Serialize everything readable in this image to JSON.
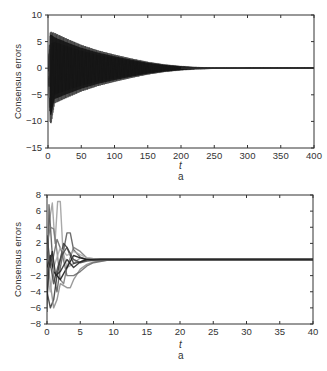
{
  "chart_data": [
    {
      "type": "line",
      "title": "",
      "xlabel": "t",
      "ylabel": "Consensus errors",
      "sublabel": "a",
      "xlim": [
        0,
        400
      ],
      "ylim": [
        -15,
        10
      ],
      "xticks": [
        0,
        50,
        100,
        150,
        200,
        250,
        300,
        350,
        400
      ],
      "yticks": [
        10,
        5,
        0,
        -5,
        -10,
        -15
      ],
      "grid": false,
      "legend": null,
      "description": "Many oscillating error trajectories forming a decaying envelope; converge to 0 around t≈250",
      "envelope": {
        "t": [
          0,
          3,
          5,
          10,
          25,
          50,
          75,
          100,
          125,
          150,
          175,
          200,
          225,
          250,
          300,
          400
        ],
        "upper": [
          0,
          9,
          9,
          8.3,
          7.2,
          5.5,
          4.2,
          3.2,
          2.3,
          1.5,
          0.9,
          0.5,
          0.2,
          0.05,
          0,
          0
        ],
        "lower": [
          0,
          -12.5,
          -12.5,
          -8.3,
          -7.2,
          -5.5,
          -4.2,
          -3.2,
          -2.3,
          -1.5,
          -0.9,
          -0.5,
          -0.2,
          -0.05,
          0,
          0
        ]
      },
      "oscillation_period": 5.5
    },
    {
      "type": "line",
      "title": "",
      "xlabel": "t",
      "ylabel": "Consensus errors",
      "sublabel": "a",
      "xlim": [
        0,
        40
      ],
      "ylim": [
        -8,
        8
      ],
      "xticks": [
        0,
        5,
        10,
        15,
        20,
        25,
        30,
        35,
        40
      ],
      "yticks": [
        8,
        6,
        4,
        2,
        0,
        -2,
        -4,
        -6,
        -8
      ],
      "grid": false,
      "legend": null,
      "description": "Multiple grey/black trajectories with transient spikes converging to 0 by t≈10",
      "series": [
        {
          "name": "s1",
          "color": "#9a9a9a",
          "t": [
            0,
            0.4,
            0.8,
            1.2,
            1.6,
            2.0,
            2.4,
            3,
            4,
            5,
            6,
            8,
            10,
            40
          ],
          "values": [
            0,
            5,
            7,
            2,
            7.2,
            7.2,
            1,
            -1,
            -0.5,
            0.2,
            0,
            0,
            0,
            0
          ]
        },
        {
          "name": "s2",
          "color": "#555555",
          "t": [
            0,
            0.3,
            0.6,
            1,
            1.5,
            2,
            3,
            3.5,
            4,
            5,
            6,
            8,
            10,
            40
          ],
          "values": [
            -6.5,
            6.8,
            3,
            -2,
            -4,
            -1,
            3.3,
            3.3,
            1.2,
            0.3,
            0,
            0,
            0,
            0
          ]
        },
        {
          "name": "s3",
          "color": "#777777",
          "t": [
            0,
            0.5,
            1,
            1.5,
            2,
            2.5,
            3,
            4,
            5,
            6,
            8,
            10,
            40
          ],
          "values": [
            2,
            4,
            3.8,
            1,
            -2.5,
            -3,
            -1,
            1.5,
            1,
            0.2,
            0,
            0,
            0
          ]
        },
        {
          "name": "s4",
          "color": "#333333",
          "t": [
            0,
            0.5,
            1,
            1.5,
            2,
            2.5,
            3,
            4,
            5,
            6,
            8,
            10,
            40
          ],
          "values": [
            -4,
            -6,
            -5,
            -2,
            0,
            2,
            1.5,
            -0.5,
            -0.3,
            0,
            0,
            0,
            0
          ]
        },
        {
          "name": "s5",
          "color": "#888888",
          "t": [
            0,
            0.5,
            1,
            1.5,
            2,
            3,
            3.5,
            4,
            5,
            6,
            7,
            9,
            12,
            40
          ],
          "values": [
            0.5,
            -3,
            -6,
            -5,
            -3,
            -3.5,
            -3.5,
            -2.5,
            -1.2,
            -0.6,
            -0.3,
            -0.1,
            0,
            0
          ]
        },
        {
          "name": "s6",
          "color": "#111111",
          "t": [
            0,
            0.5,
            1,
            1.5,
            2,
            3,
            4,
            5,
            6,
            8,
            10,
            40
          ],
          "values": [
            -1,
            0.5,
            -1.5,
            -2,
            -2.5,
            -1,
            0.5,
            0.2,
            0,
            0,
            0,
            0
          ]
        },
        {
          "name": "s7",
          "color": "#666666",
          "t": [
            0,
            0.5,
            1,
            1.5,
            2.2,
            3,
            4,
            5,
            6,
            7,
            9,
            12,
            40
          ],
          "values": [
            1,
            -1,
            0.5,
            2.5,
            1,
            -2,
            -2,
            -1.5,
            -0.8,
            -0.4,
            -0.1,
            0,
            0
          ]
        },
        {
          "name": "s8",
          "color": "#aaaaaa",
          "t": [
            0,
            0.5,
            1,
            2,
            3,
            4,
            5,
            6,
            8,
            10,
            40
          ],
          "values": [
            -2,
            -4,
            -1,
            1.5,
            0.5,
            1,
            0.6,
            0.2,
            0,
            0,
            0
          ]
        },
        {
          "name": "s9",
          "color": "#444444",
          "t": [
            0,
            0.4,
            1,
            1.6,
            2.2,
            3,
            4,
            5,
            6,
            8,
            10,
            40
          ],
          "values": [
            3,
            0,
            -3,
            -1,
            0.5,
            1.5,
            0,
            -0.4,
            -0.2,
            0,
            0,
            0
          ]
        },
        {
          "name": "s10",
          "color": "#222222",
          "t": [
            0,
            0.3,
            0.8,
            1.3,
            2,
            3,
            4,
            5,
            6,
            8,
            10,
            40
          ],
          "values": [
            -5,
            -1,
            1,
            -2,
            -1.5,
            0,
            -1,
            -0.3,
            0,
            0,
            0,
            0
          ]
        }
      ]
    }
  ]
}
